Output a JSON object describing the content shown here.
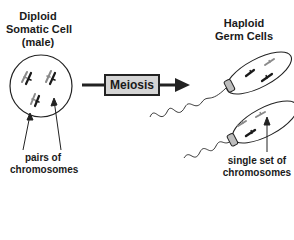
{
  "diagram": {
    "left_title": [
      "Diploid",
      "Somatic Cell",
      "(male)"
    ],
    "right_title": [
      "Haploid",
      "Germ Cells"
    ],
    "process_label": "Meiosis",
    "left_annotation": [
      "pairs of",
      "chromosomes"
    ],
    "right_annotation": [
      "single set of",
      "chromosomes"
    ]
  },
  "colors": {
    "stroke": "#222222",
    "box_fill": "#d4d4d4",
    "chromosome_gray": "#8a8a8a",
    "chromosome_dark": "#1a1a1a"
  }
}
